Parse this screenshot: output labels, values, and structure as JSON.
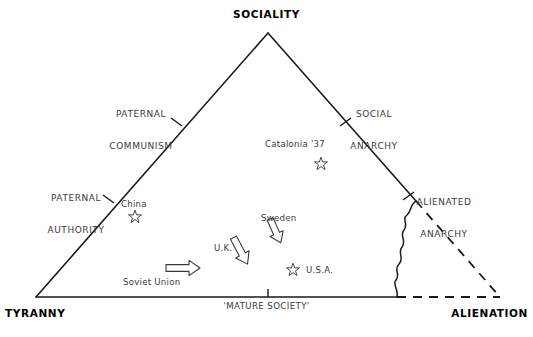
{
  "diagram": {
    "stroke_color": "#1a1a1a",
    "text_color": "#3a3a3a",
    "background": "#ffffff",
    "vertices": [
      {
        "name": "sociality",
        "label": "SOCIALITY",
        "x": 268,
        "y": 33,
        "label_x": 268,
        "label_y": 10,
        "anchor": "middle"
      },
      {
        "name": "tyranny",
        "label": "TYRANNY",
        "x": 36,
        "y": 297,
        "label_x": 4,
        "label_y": 312,
        "anchor": "start"
      },
      {
        "name": "alienation",
        "label": "ALIENATION",
        "x": 500,
        "y": 297,
        "label_x": 529,
        "label_y": 312,
        "anchor": "end"
      }
    ],
    "zone_labels": [
      {
        "name": "paternal-communism",
        "line1": "PATERNAL",
        "line2": "COMMUNISM",
        "x": 140,
        "y": 92
      },
      {
        "name": "social-anarchy",
        "line1": "SOCIAL",
        "line2": "ANARCHY",
        "x": 374,
        "y": 92
      },
      {
        "name": "paternal-authority",
        "line1": "PATERNAL",
        "line2": "AUTHORITY",
        "x": 76,
        "y": 175
      },
      {
        "name": "alienated-anarchy",
        "line1": "ALIENATED",
        "line2": "ANARCHY",
        "x": 443,
        "y": 180
      }
    ],
    "axis_labels": [
      {
        "name": "mature-society",
        "label": "'MATURE SOCIETY'",
        "x": 268,
        "y": 306
      }
    ],
    "tick_marks": [
      {
        "name": "tick-paternal-communism",
        "x1": 171,
        "y1": 118,
        "x2": 182,
        "y2": 126
      },
      {
        "name": "tick-paternal-authority",
        "x1": 103,
        "y1": 195,
        "x2": 114,
        "y2": 203
      },
      {
        "name": "tick-social-anarchy",
        "x1": 351,
        "y1": 118,
        "x2": 340,
        "y2": 126
      },
      {
        "name": "tick-alienated-anarchy",
        "x1": 414,
        "y1": 192,
        "x2": 403,
        "y2": 200
      },
      {
        "name": "tick-mature-society",
        "x1": 268,
        "y1": 297,
        "x2": 268,
        "y2": 290
      }
    ],
    "points": [
      {
        "name": "catalonia-37",
        "label": "Catalonia '37",
        "label_x": 266,
        "label_y": 140,
        "star_x": 321,
        "star_y": 164
      },
      {
        "name": "china",
        "label": "China",
        "label_x": 122,
        "label_y": 200,
        "star_x": 135,
        "star_y": 217
      },
      {
        "name": "usa",
        "label": "U.S.A.",
        "label_x": 307,
        "label_y": 266,
        "star_x": 293,
        "star_y": 270
      }
    ],
    "arrows": [
      {
        "name": "soviet-union-arrow",
        "label": "Soviet Union",
        "label_x": 124,
        "label_y": 279,
        "x": 168,
        "y": 268,
        "angle": 0,
        "length": 34
      },
      {
        "name": "uk-arrow",
        "label": "U.K.",
        "label_x": 215,
        "label_y": 245,
        "x": 238,
        "y": 248,
        "angle": 62,
        "length": 34
      },
      {
        "name": "sweden-arrow",
        "label": "Sweden",
        "label_x": 262,
        "label_y": 216,
        "x": 272,
        "y": 226,
        "angle": 63,
        "length": 30
      }
    ],
    "edges": [
      {
        "name": "left-edge",
        "style": "solid",
        "from": "tyranny",
        "to": "sociality"
      },
      {
        "name": "right-edge-solid",
        "style": "solid",
        "from": "sociality",
        "to": "alienated-anarchy-break"
      },
      {
        "name": "right-edge-dashed",
        "style": "dashed",
        "from": "alienated-anarchy-break",
        "to": "alienation"
      },
      {
        "name": "base-edge-solid",
        "style": "solid",
        "from": "tyranny",
        "to": "wavy-base"
      },
      {
        "name": "base-edge-dashed",
        "style": "dashed",
        "from": "wavy-base",
        "to": "alienation"
      },
      {
        "name": "wavy-boundary",
        "style": "wavy",
        "from": "alienated-anarchy-break",
        "to": "wavy-base"
      }
    ]
  }
}
